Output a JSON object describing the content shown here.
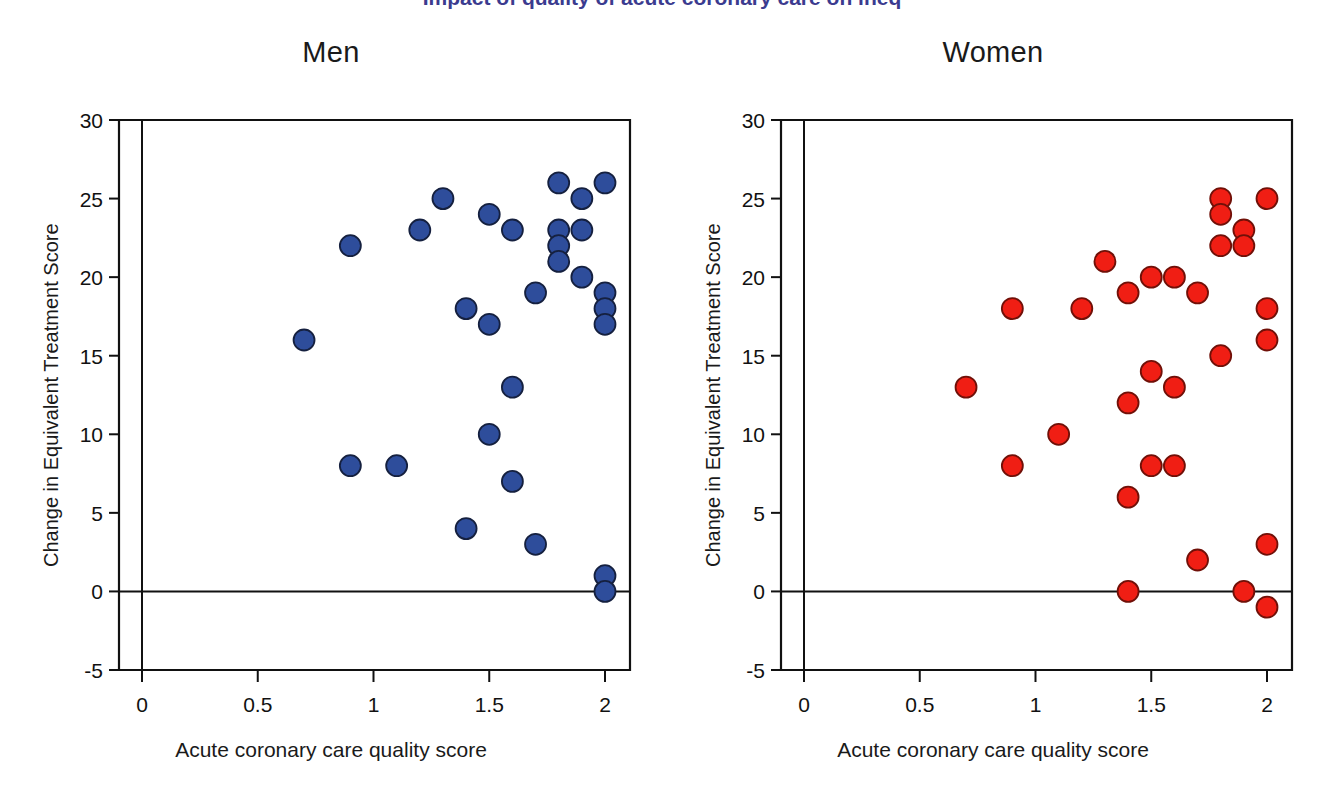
{
  "figure": {
    "cut_off_header": "Impact of quality of acute coronary care on ineq",
    "background": "#ffffff"
  },
  "axes": {
    "x_label": "Acute coronary care quality score",
    "y_label": "Change in Equivalent Treatment Score",
    "x_ticks": [
      "0",
      "0.5",
      "1",
      "1.5",
      "2"
    ],
    "x_tick_values": [
      0,
      0.5,
      1,
      1.5,
      2
    ],
    "y_ticks": [
      "-5",
      "0",
      "5",
      "10",
      "15",
      "20",
      "25",
      "30"
    ],
    "y_tick_values": [
      -5,
      0,
      5,
      10,
      15,
      20,
      25,
      30
    ],
    "xlim": [
      -0.1,
      2.1
    ],
    "ylim": [
      -5,
      30
    ],
    "zero_line": true,
    "grid": false
  },
  "panels": [
    {
      "id": "men",
      "title": "Men",
      "color": "#2e4d9b",
      "edge": "#15203f"
    },
    {
      "id": "women",
      "title": "Women",
      "color": "#f01e14",
      "edge": "#701008"
    }
  ],
  "chart_data": [
    {
      "type": "scatter",
      "title": "Men",
      "xlabel": "Acute coronary care quality score",
      "ylabel": "Change in Equivalent Treatment Score",
      "xlim": [
        -0.1,
        2.1
      ],
      "ylim": [
        -5,
        30
      ],
      "marker_color": "#2e4d9b",
      "marker_edge_color": "#15203f",
      "grid": false,
      "legend": "none",
      "points": [
        {
          "x": 0.7,
          "y": 16
        },
        {
          "x": 0.9,
          "y": 22
        },
        {
          "x": 0.9,
          "y": 8
        },
        {
          "x": 1.1,
          "y": 8
        },
        {
          "x": 1.2,
          "y": 23
        },
        {
          "x": 1.3,
          "y": 25
        },
        {
          "x": 1.4,
          "y": 18
        },
        {
          "x": 1.4,
          "y": 4
        },
        {
          "x": 1.5,
          "y": 24
        },
        {
          "x": 1.5,
          "y": 17
        },
        {
          "x": 1.5,
          "y": 10
        },
        {
          "x": 1.6,
          "y": 23
        },
        {
          "x": 1.6,
          "y": 13
        },
        {
          "x": 1.6,
          "y": 7
        },
        {
          "x": 1.7,
          "y": 19
        },
        {
          "x": 1.7,
          "y": 3
        },
        {
          "x": 1.8,
          "y": 26
        },
        {
          "x": 1.8,
          "y": 23
        },
        {
          "x": 1.8,
          "y": 22
        },
        {
          "x": 1.8,
          "y": 21
        },
        {
          "x": 1.9,
          "y": 25
        },
        {
          "x": 1.9,
          "y": 23
        },
        {
          "x": 1.9,
          "y": 20
        },
        {
          "x": 2.0,
          "y": 26
        },
        {
          "x": 2.0,
          "y": 19
        },
        {
          "x": 2.0,
          "y": 18
        },
        {
          "x": 2.0,
          "y": 17
        },
        {
          "x": 2.0,
          "y": 1
        },
        {
          "x": 2.0,
          "y": 0
        }
      ]
    },
    {
      "type": "scatter",
      "title": "Women",
      "xlabel": "Acute coronary care quality score",
      "ylabel": "Change in Equivalent Treatment Score",
      "xlim": [
        -0.1,
        2.1
      ],
      "ylim": [
        -5,
        30
      ],
      "marker_color": "#f01e14",
      "marker_edge_color": "#701008",
      "grid": false,
      "legend": "none",
      "points": [
        {
          "x": 0.7,
          "y": 13
        },
        {
          "x": 0.9,
          "y": 18
        },
        {
          "x": 0.9,
          "y": 8
        },
        {
          "x": 1.1,
          "y": 10
        },
        {
          "x": 1.2,
          "y": 18
        },
        {
          "x": 1.3,
          "y": 21
        },
        {
          "x": 1.4,
          "y": 19
        },
        {
          "x": 1.4,
          "y": 12
        },
        {
          "x": 1.4,
          "y": 6
        },
        {
          "x": 1.4,
          "y": 0
        },
        {
          "x": 1.5,
          "y": 20
        },
        {
          "x": 1.5,
          "y": 14
        },
        {
          "x": 1.5,
          "y": 8
        },
        {
          "x": 1.6,
          "y": 20
        },
        {
          "x": 1.6,
          "y": 13
        },
        {
          "x": 1.6,
          "y": 8
        },
        {
          "x": 1.7,
          "y": 19
        },
        {
          "x": 1.7,
          "y": 2
        },
        {
          "x": 1.8,
          "y": 25
        },
        {
          "x": 1.8,
          "y": 24
        },
        {
          "x": 1.8,
          "y": 22
        },
        {
          "x": 1.8,
          "y": 15
        },
        {
          "x": 1.9,
          "y": 23
        },
        {
          "x": 1.9,
          "y": 22
        },
        {
          "x": 1.9,
          "y": 0
        },
        {
          "x": 2.0,
          "y": 25
        },
        {
          "x": 2.0,
          "y": 18
        },
        {
          "x": 2.0,
          "y": 16
        },
        {
          "x": 2.0,
          "y": 3
        },
        {
          "x": 2.0,
          "y": -1
        }
      ]
    }
  ]
}
